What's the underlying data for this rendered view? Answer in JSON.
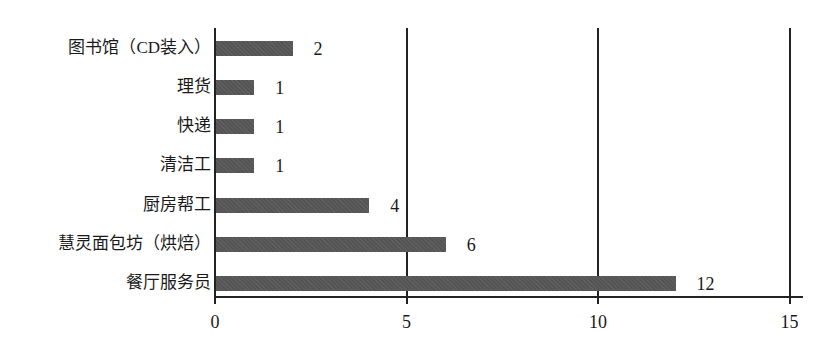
{
  "chart_data": {
    "type": "bar",
    "orientation": "horizontal",
    "title": "",
    "xlabel": "",
    "ylabel": "",
    "categories": [
      "图书馆（CD装入）",
      "理货",
      "快递",
      "清洁工",
      "厨房帮工",
      "慧灵面包坊（烘焙）",
      "餐厅服务员"
    ],
    "values": [
      2,
      1,
      1,
      1,
      4,
      6,
      12
    ],
    "xlim": [
      0,
      15
    ],
    "xticks": [
      0,
      5,
      10,
      15
    ],
    "xtick_labels": [
      "0",
      "5",
      "10",
      "15"
    ],
    "grid": "vertical lines at 5, 10, 15",
    "data_labels": true,
    "bar_color": "#555555",
    "legend": null
  }
}
